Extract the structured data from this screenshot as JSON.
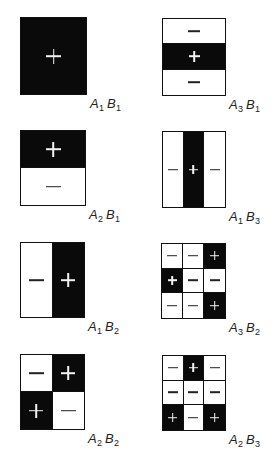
{
  "figure": {
    "panels": [
      {
        "id": "A1B1",
        "label": {
          "a": "A",
          "a_sub": "1",
          "b": "B",
          "b_sub": "1"
        },
        "rows": 1,
        "cols": 1,
        "cells": [
          [
            "+"
          ]
        ],
        "box": {
          "x": 20,
          "y": 17,
          "w": 67,
          "h": 78
        },
        "grid_lines": false
      },
      {
        "id": "A3B1",
        "label": {
          "a": "A",
          "a_sub": "3",
          "b": "B",
          "b_sub": "1"
        },
        "rows": 3,
        "cols": 1,
        "cells": [
          [
            "-"
          ],
          [
            "+"
          ],
          [
            "-"
          ]
        ],
        "box": {
          "x": 162,
          "y": 18,
          "w": 64,
          "h": 78
        },
        "grid_lines": true
      },
      {
        "id": "A2B1",
        "label": {
          "a": "A",
          "a_sub": "2",
          "b": "B",
          "b_sub": "1"
        },
        "rows": 2,
        "cols": 1,
        "cells": [
          [
            "+"
          ],
          [
            "-"
          ]
        ],
        "box": {
          "x": 20,
          "y": 130,
          "w": 66,
          "h": 76
        },
        "grid_lines": true
      },
      {
        "id": "A1B3",
        "label": {
          "a": "A",
          "a_sub": "1",
          "b": "B",
          "b_sub": "3"
        },
        "rows": 1,
        "cols": 3,
        "cells": [
          [
            "-",
            "+",
            "-"
          ]
        ],
        "box": {
          "x": 162,
          "y": 131,
          "w": 64,
          "h": 77
        },
        "grid_lines": true
      },
      {
        "id": "A1B2",
        "label": {
          "a": "A",
          "a_sub": "1",
          "b": "B",
          "b_sub": "2"
        },
        "rows": 1,
        "cols": 2,
        "cells": [
          [
            "-",
            "+"
          ]
        ],
        "box": {
          "x": 20,
          "y": 242,
          "w": 65,
          "h": 76
        },
        "grid_lines": true
      },
      {
        "id": "A3B2",
        "label": {
          "a": "A",
          "a_sub": "3",
          "b": "B",
          "b_sub": "2"
        },
        "rows": 3,
        "cols": 3,
        "cells": [
          [
            "-",
            "-",
            "+"
          ],
          [
            "+",
            "-",
            "-"
          ],
          [
            "-",
            "-",
            "+"
          ]
        ],
        "box": {
          "x": 161,
          "y": 243,
          "w": 65,
          "h": 76
        },
        "grid_lines": true
      },
      {
        "id": "A2B2",
        "label": {
          "a": "A",
          "a_sub": "2",
          "b": "B",
          "b_sub": "2"
        },
        "rows": 2,
        "cols": 2,
        "cells": [
          [
            "-",
            "+"
          ],
          [
            "+",
            "-"
          ]
        ],
        "box": {
          "x": 20,
          "y": 354,
          "w": 65,
          "h": 76
        },
        "grid_lines": true
      },
      {
        "id": "A2B3",
        "label": {
          "a": "A",
          "a_sub": "2",
          "b": "B",
          "b_sub": "3"
        },
        "rows": 3,
        "cols": 3,
        "cells": [
          [
            "-",
            "+",
            "-"
          ],
          [
            "-",
            "-",
            "-"
          ],
          [
            "+",
            "-",
            "+"
          ]
        ],
        "box": {
          "x": 162,
          "y": 355,
          "w": 64,
          "h": 76
        },
        "grid_lines": true
      }
    ]
  },
  "colors": {
    "positive_fill": "#0a0a0a",
    "negative_fill": "#ffffff",
    "positive_sign": "#f2f2f2",
    "negative_sign": "#222222",
    "border": "#111111"
  }
}
